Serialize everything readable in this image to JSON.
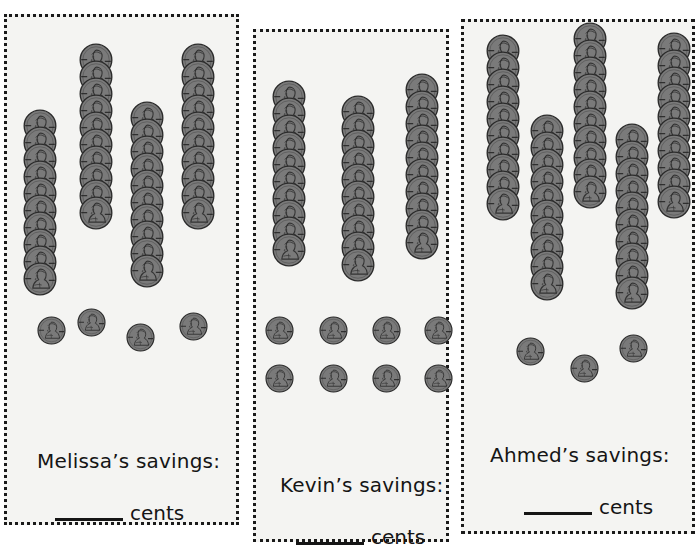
{
  "worksheet": {
    "background_color": "#ffffff",
    "panel_background": "#f4f4f2",
    "border_color": "#1a1a1a",
    "coin_color": "#7a7a7a",
    "coin_outline_color": "#2b2b2b"
  },
  "panels": [
    {
      "id": "melissa",
      "name_label": "Melissa’s savings:",
      "cents_label": "cents",
      "answer_value": "",
      "dime_stacks": [
        {
          "count": 10,
          "x": 16,
          "y": 92
        },
        {
          "count": 10,
          "x": 72,
          "y": 26
        },
        {
          "count": 10,
          "x": 123,
          "y": 84
        },
        {
          "count": 10,
          "x": 174,
          "y": 26
        }
      ],
      "pennies": [
        {
          "x": 30,
          "y": 299
        },
        {
          "x": 70,
          "y": 291
        },
        {
          "x": 119,
          "y": 306
        },
        {
          "x": 172,
          "y": 295
        }
      ],
      "dime_total": 40,
      "penny_total": 4,
      "total_cents": 404
    },
    {
      "id": "kevin",
      "name_label": "Kevin’s savings:",
      "cents_label": "cents",
      "answer_value": "",
      "dime_stacks": [
        {
          "count": 10,
          "x": 16,
          "y": 48
        },
        {
          "count": 10,
          "x": 85,
          "y": 63
        },
        {
          "count": 10,
          "x": 149,
          "y": 41
        }
      ],
      "pennies": [
        {
          "x": 9,
          "y": 284
        },
        {
          "x": 63,
          "y": 284
        },
        {
          "x": 116,
          "y": 284
        },
        {
          "x": 168,
          "y": 284
        },
        {
          "x": 9,
          "y": 332
        },
        {
          "x": 63,
          "y": 332
        },
        {
          "x": 116,
          "y": 332
        },
        {
          "x": 168,
          "y": 332
        }
      ],
      "dime_total": 30,
      "penny_total": 8,
      "total_cents": 308
    },
    {
      "id": "ahmed",
      "name_label": "Ahmed’s savings:",
      "cents_label": "cents",
      "answer_value": "",
      "dime_stacks": [
        {
          "count": 10,
          "x": 22,
          "y": 12
        },
        {
          "count": 10,
          "x": 66,
          "y": 92
        },
        {
          "count": 10,
          "x": 109,
          "y": 0
        },
        {
          "count": 10,
          "x": 151,
          "y": 101
        },
        {
          "count": 10,
          "x": 193,
          "y": 10
        }
      ],
      "pennies": [
        {
          "x": 52,
          "y": 315
        },
        {
          "x": 106,
          "y": 332
        },
        {
          "x": 155,
          "y": 312
        }
      ],
      "dime_total": 50,
      "penny_total": 3,
      "total_cents": 503
    }
  ],
  "icons": {
    "dime": "dime-coin-icon",
    "penny": "penny-coin-icon"
  }
}
